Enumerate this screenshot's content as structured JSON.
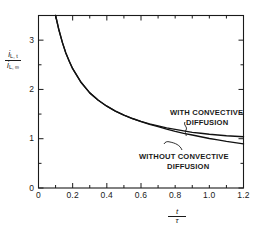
{
  "chart_data": {
    "type": "line",
    "title": "",
    "xlabel": "t / τ",
    "ylabel": "i(L,t) / i(L,∞)",
    "xlim": [
      0,
      1.2
    ],
    "ylim": [
      0,
      3.5
    ],
    "grid": false,
    "legend_position": "inline-annotation",
    "xticks": [
      "0",
      "0.2",
      "0.4",
      "0.6",
      "0.8",
      "1.0",
      "1.2"
    ],
    "xtick_values": [
      0,
      0.2,
      0.4,
      0.6,
      0.8,
      1.0,
      1.2
    ],
    "xminor_step": 0.1,
    "yticks": [
      "0",
      "1",
      "2",
      "3"
    ],
    "ytick_values": [
      0,
      1,
      2,
      3
    ],
    "yminor_step": 0.5,
    "series": [
      {
        "name": "WITH CONVECTIVE DIFFUSION",
        "x": [
          0.1,
          0.12,
          0.14,
          0.16,
          0.18,
          0.2,
          0.25,
          0.3,
          0.35,
          0.4,
          0.45,
          0.5,
          0.55,
          0.6,
          0.65,
          0.7,
          0.75,
          0.8,
          0.85,
          0.9,
          0.95,
          1.0,
          1.05,
          1.1,
          1.15,
          1.2
        ],
        "y": [
          3.52,
          3.2,
          2.95,
          2.74,
          2.57,
          2.42,
          2.14,
          1.93,
          1.78,
          1.66,
          1.56,
          1.48,
          1.41,
          1.35,
          1.3,
          1.26,
          1.22,
          1.19,
          1.16,
          1.13,
          1.11,
          1.09,
          1.075,
          1.06,
          1.05,
          1.04
        ]
      },
      {
        "name": "WITHOUT CONVECTIVE DIFFUSION",
        "x": [
          0.1,
          0.12,
          0.14,
          0.16,
          0.18,
          0.2,
          0.25,
          0.3,
          0.35,
          0.4,
          0.45,
          0.5,
          0.55,
          0.6,
          0.65,
          0.7,
          0.75,
          0.8,
          0.85,
          0.9,
          0.95,
          1.0,
          1.05,
          1.1,
          1.15,
          1.2
        ],
        "y": [
          3.52,
          3.2,
          2.95,
          2.74,
          2.57,
          2.42,
          2.14,
          1.93,
          1.78,
          1.66,
          1.56,
          1.48,
          1.41,
          1.345,
          1.29,
          1.245,
          1.195,
          1.15,
          1.11,
          1.075,
          1.04,
          1.005,
          0.975,
          0.945,
          0.92,
          0.895
        ]
      }
    ],
    "annotations": [
      {
        "text": "WITH CONVECTIVE DIFFUSION",
        "lines": [
          "WITH  CONVECTIVE",
          "DIFFUSION"
        ],
        "target_x": 0.92,
        "target_y": 1.12
      },
      {
        "text": "WITHOUT CONVECTIVE DIFFUSION",
        "lines": [
          "WITHOUT  CONVECTIVE",
          "DIFFUSION"
        ],
        "target_x": 0.86,
        "target_y": 1.1
      }
    ],
    "axis_label_parts": {
      "y_numerator": "i",
      "y_numerator_sub": "L, t",
      "y_denominator": "i",
      "y_denominator_sub": "L, ∞",
      "x_numerator": "t",
      "x_denominator": "τ"
    },
    "colors": {
      "curve": "#111111",
      "axis": "#1a1a1a",
      "background": "#ffffff"
    }
  },
  "axis": {
    "xticks": [
      "0",
      "0.2",
      "0.4",
      "0.6",
      "0.8",
      "1.0",
      "1.2"
    ],
    "yticks": [
      "3",
      "2",
      "1",
      "0"
    ]
  },
  "annotations": {
    "with_line1": "WITH  CONVECTIVE",
    "with_line2": "DIFFUSION",
    "without_line1": "WITHOUT  CONVECTIVE",
    "without_line2": "DIFFUSION"
  },
  "labels": {
    "y_num": "i",
    "y_num_sub": "L, t",
    "y_den": "i",
    "y_den_sub": "L, ∞",
    "x_num": "t",
    "x_den": "τ"
  }
}
